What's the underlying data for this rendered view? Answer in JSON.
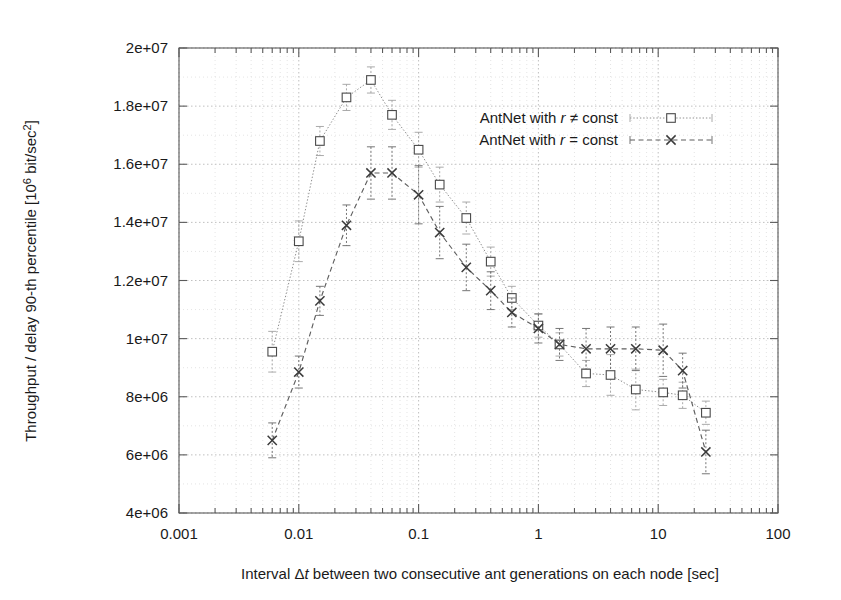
{
  "chart_data": {
    "type": "line",
    "title": "",
    "xlabel": "Interval Δt between two consecutive ant generations on each node [sec]",
    "ylabel": "Throughput / delay 90-th percentile [10⁶ bit/sec²]",
    "xscale": "log",
    "yscale": "linear",
    "xlim": [
      0.001,
      100
    ],
    "ylim": [
      4000000,
      20000000
    ],
    "xticks": [
      "0.001",
      "0.01",
      "0.1",
      "1",
      "10",
      "100"
    ],
    "xtick_values": [
      0.001,
      0.01,
      0.1,
      1,
      10,
      100
    ],
    "yticks": [
      "4e+06",
      "6e+06",
      "8e+06",
      "1e+07",
      "1.2e+07",
      "1.4e+07",
      "1.6e+07",
      "1.8e+07",
      "2e+07"
    ],
    "ytick_values": [
      4000000,
      6000000,
      8000000,
      10000000,
      12000000,
      14000000,
      16000000,
      18000000,
      20000000
    ],
    "grid": true,
    "grid_style": "dotted major and minor on both axes",
    "legend_position": "upper right inside plot",
    "series": [
      {
        "name": "AntNet with r ≠ const",
        "marker": "open-square",
        "line_style": "dotted",
        "color": "#8e8e8e",
        "x": [
          0.006,
          0.01,
          0.015,
          0.025,
          0.04,
          0.06,
          0.1,
          0.15,
          0.25,
          0.4,
          0.6,
          1.0,
          1.5,
          2.5,
          4.0,
          6.5,
          11.0,
          16.0,
          25.0
        ],
        "y": [
          9550000,
          13350000,
          16800000,
          18300000,
          18900000,
          17700000,
          16500000,
          15300000,
          14150000,
          12650000,
          11400000,
          10450000,
          9800000,
          8800000,
          8750000,
          8250000,
          8150000,
          8050000,
          7450000
        ],
        "yerr": [
          700000,
          700000,
          500000,
          450000,
          450000,
          500000,
          600000,
          600000,
          550000,
          500000,
          400000,
          400000,
          400000,
          450000,
          700000,
          700000,
          450000,
          450000,
          400000
        ]
      },
      {
        "name": "AntNet with r = const",
        "marker": "cross-x",
        "line_style": "dashed",
        "color": "#5f5f5f",
        "x": [
          0.006,
          0.01,
          0.015,
          0.025,
          0.04,
          0.06,
          0.1,
          0.15,
          0.25,
          0.4,
          0.6,
          1.0,
          1.5,
          2.5,
          4.0,
          6.5,
          11.0,
          16.0,
          25.0
        ],
        "y": [
          6500000,
          8850000,
          11300000,
          13900000,
          15700000,
          15700000,
          14950000,
          13650000,
          12450000,
          11650000,
          10900000,
          10350000,
          9800000,
          9650000,
          9650000,
          9650000,
          9600000,
          8900000,
          6100000
        ],
        "yerr": [
          600000,
          550000,
          500000,
          700000,
          900000,
          900000,
          1000000,
          900000,
          800000,
          650000,
          500000,
          500000,
          550000,
          700000,
          750000,
          750000,
          900000,
          600000,
          750000
        ]
      }
    ],
    "annotations": []
  },
  "legend": {
    "entries": [
      {
        "label": "AntNet with r ≠ const"
      },
      {
        "label": "AntNet with r = const"
      }
    ]
  }
}
